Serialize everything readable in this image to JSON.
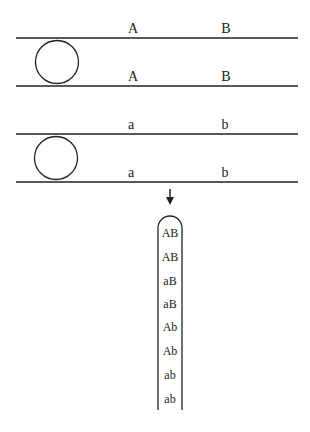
{
  "diagram": {
    "chromosome_pair_1": {
      "top_labels": [
        "A",
        "B"
      ],
      "bottom_labels": [
        "A",
        "B"
      ]
    },
    "chromosome_pair_2": {
      "top_labels": [
        "a",
        "b"
      ],
      "bottom_labels": [
        "a",
        "b"
      ]
    },
    "tube": {
      "rows": [
        "AB",
        "AB",
        "aB",
        "aB",
        "Ab",
        "Ab",
        "ab",
        "ab"
      ]
    },
    "colors": {
      "line": "#222222",
      "background": "#ffffff"
    }
  }
}
